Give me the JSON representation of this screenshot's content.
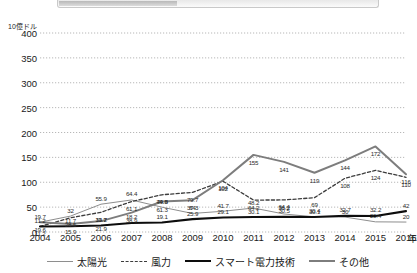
{
  "y_axis": {
    "unit_label": "10億ドル",
    "ticks": [
      "0",
      "50",
      "100",
      "150",
      "200",
      "250",
      "300",
      "350",
      "400"
    ],
    "min": 0,
    "max": 400,
    "step": 50
  },
  "x_axis": {
    "name": "年",
    "ticks": [
      "2004",
      "2005",
      "2006",
      "2007",
      "2008",
      "2009",
      "2010",
      "2011",
      "2012",
      "2013",
      "2014",
      "2015",
      "2016"
    ]
  },
  "legend": {
    "items": [
      {
        "label": "太陽光",
        "style": "solid-thin",
        "color": "#8a8a8a"
      },
      {
        "label": "風力",
        "style": "dashed",
        "color": "#4a4a4a"
      },
      {
        "label": "スマート電力技術",
        "style": "solid-thick",
        "color": "#111111"
      },
      {
        "label": "その他",
        "style": "solid-medium",
        "color": "#808080"
      }
    ]
  },
  "chart_data": {
    "type": "line",
    "title": "",
    "xlabel": "年",
    "ylabel": "10億ドル",
    "ylim": [
      0,
      400
    ],
    "grid": true,
    "legend_position": "bottom",
    "x": [
      "2004",
      "2005",
      "2006",
      "2007",
      "2008",
      "2009",
      "2010",
      "2011",
      "2012",
      "2013",
      "2014",
      "2015",
      "2016"
    ],
    "series": [
      {
        "name": "太陽光",
        "values": [
          19.7,
          32,
          55.9,
          64.4,
          49.9,
          37.3,
          41.7,
          48.2,
          36.2,
          30.4,
          30,
          20.4,
          20
        ],
        "labels": [
          "19.7",
          "32",
          "55.9",
          "64.4",
          "49.9",
          "37.3",
          "41.7",
          "48.2",
          "36.2",
          "30.4",
          "30",
          "20.4",
          "20"
        ]
      },
      {
        "name": "風力",
        "values": [
          11.2,
          28.5,
          39.7,
          61.1,
          74.8,
          79.7,
          102,
          64.2,
          64.4,
          69,
          108,
          124,
          110
        ],
        "labels": [
          "11.2",
          "28.5",
          "39.7",
          "61.1",
          "74.8",
          "79.7",
          "102",
          "64.2",
          "64.4",
          "69",
          "108",
          "124",
          "110"
        ]
      },
      {
        "name": "スマート電力技術",
        "values": [
          11.2,
          11.7,
          13.2,
          18.2,
          19.1,
          25.9,
          29.1,
          30.1,
          30.5,
          30.1,
          32.7,
          32.2,
          42
        ],
        "labels": [
          "11.2",
          "11.7",
          "13.2",
          "18.2",
          "19.1",
          "25.9",
          "29.1",
          "30.1",
          "30.5",
          "30.1",
          "32.7",
          "32.2",
          "42"
        ]
      },
      {
        "name": "その他",
        "values": [
          19.6,
          15.9,
          21.9,
          38.9,
          61.3,
          64,
          104,
          155,
          141,
          119,
          144,
          172,
          116
        ],
        "labels": [
          "19.6",
          "15.9",
          "21.9",
          "38.9",
          "61.3",
          "64",
          "104",
          "155",
          "141",
          "119",
          "144",
          "172",
          "116"
        ]
      }
    ]
  }
}
